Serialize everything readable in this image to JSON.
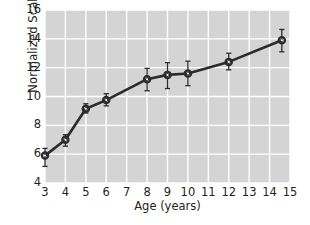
{
  "chart_data": {
    "type": "line",
    "title": "",
    "xlabel": "Age (years)",
    "ylabel": "Normalized Scaled Score",
    "xlim": [
      3,
      15
    ],
    "ylim": [
      4,
      16
    ],
    "xticks": [
      3,
      4,
      5,
      6,
      7,
      8,
      9,
      10,
      11,
      12,
      13,
      14,
      15
    ],
    "yticks": [
      4,
      6,
      8,
      10,
      12,
      14,
      16
    ],
    "grid": true,
    "legend": "none",
    "marker": "open-circle",
    "line_color": "#2b2b2b",
    "plot_background": "#d4d4d4",
    "gridline_color": "#ffffff",
    "x": [
      3,
      4,
      5,
      6,
      8,
      9,
      10,
      12,
      14.6
    ],
    "values": [
      5.9,
      7.0,
      9.15,
      9.75,
      11.2,
      11.5,
      11.6,
      12.4,
      13.9
    ],
    "error_low": [
      0.75,
      0.45,
      0.3,
      0.4,
      0.8,
      0.95,
      0.85,
      0.55,
      0.8
    ],
    "error_high": [
      0.5,
      0.35,
      0.35,
      0.45,
      0.75,
      0.85,
      0.85,
      0.6,
      0.75
    ],
    "points": [
      {
        "age": 3,
        "score": 5.9,
        "err_low": 0.75,
        "err_high": 0.5
      },
      {
        "age": 4,
        "score": 7.0,
        "err_low": 0.45,
        "err_high": 0.35
      },
      {
        "age": 5,
        "score": 9.15,
        "err_low": 0.3,
        "err_high": 0.35
      },
      {
        "age": 6,
        "score": 9.75,
        "err_low": 0.4,
        "err_high": 0.45
      },
      {
        "age": 8,
        "score": 11.2,
        "err_low": 0.8,
        "err_high": 0.75
      },
      {
        "age": 9,
        "score": 11.5,
        "err_low": 0.95,
        "err_high": 0.85
      },
      {
        "age": 10,
        "score": 11.6,
        "err_low": 0.85,
        "err_high": 0.85
      },
      {
        "age": 12,
        "score": 12.4,
        "err_low": 0.55,
        "err_high": 0.6
      },
      {
        "age": 14.6,
        "score": 13.9,
        "err_low": 0.8,
        "err_high": 0.75
      }
    ]
  },
  "axes": {
    "y_label": "Normalized Scaled Score",
    "x_label": "Age (years)",
    "y_tick_labels": [
      "16",
      "14",
      "12",
      "10",
      "8",
      "6",
      "4"
    ],
    "x_tick_labels": [
      "3",
      "4",
      "5",
      "6",
      "7",
      "8",
      "9",
      "10",
      "11",
      "12",
      "13",
      "14",
      "15"
    ]
  }
}
